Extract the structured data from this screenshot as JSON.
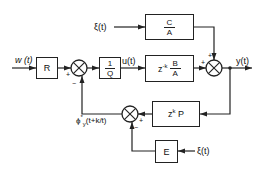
{
  "diagram": {
    "type": "control block diagram",
    "inputs": {
      "reference": "w (t)",
      "disturbance_top": "ξ(t)",
      "disturbance_bottom": "ξ(t)"
    },
    "signals": {
      "control": "u(t)",
      "output": "y(t)",
      "prediction_base": "ϕ",
      "prediction_super": "*",
      "prediction_sub": "y",
      "prediction_arg": "(t+k/t)"
    },
    "blocks": {
      "R": "R",
      "inv_Q_num": "1",
      "inv_Q_den": "Q",
      "noise_num": "C",
      "noise_den": "A",
      "plant_prefix": "z",
      "plant_exp": "-k",
      "plant_num": "B",
      "plant_den": "A",
      "predictor_prefix": "z",
      "predictor_exp": "k",
      "predictor_suffix": "P",
      "E": "E"
    },
    "signs": {
      "sum1_left": "+",
      "sum1_bottom": "−",
      "sum_out_left": "+",
      "sum_out_top": "+",
      "sum_pred_right": "+",
      "sum_pred_bottom": "−"
    }
  }
}
